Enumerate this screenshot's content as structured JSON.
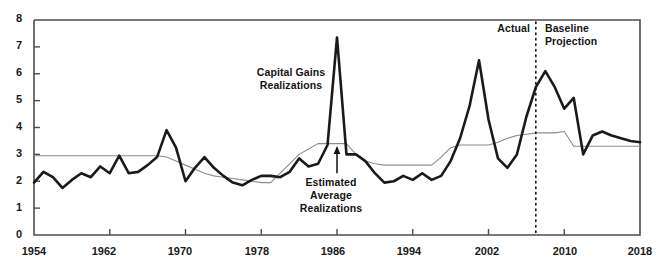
{
  "chart_data": {
    "type": "line",
    "title": "",
    "subtitle": "",
    "xlabel": "",
    "ylabel": "",
    "xlim": [
      1954,
      2018
    ],
    "ylim": [
      0,
      8
    ],
    "grid": false,
    "legend_position": "inline-annotations",
    "x_ticks": [
      1954,
      1962,
      1970,
      1978,
      1986,
      1994,
      2002,
      2010,
      2018
    ],
    "y_ticks": [
      0,
      1,
      2,
      3,
      4,
      5,
      6,
      7,
      8
    ],
    "x": [
      1954,
      1955,
      1956,
      1957,
      1958,
      1959,
      1960,
      1961,
      1962,
      1963,
      1964,
      1965,
      1966,
      1967,
      1968,
      1969,
      1970,
      1971,
      1972,
      1973,
      1974,
      1975,
      1976,
      1977,
      1978,
      1979,
      1980,
      1981,
      1982,
      1983,
      1984,
      1985,
      1986,
      1987,
      1988,
      1989,
      1990,
      1991,
      1992,
      1993,
      1994,
      1995,
      1996,
      1997,
      1998,
      1999,
      2000,
      2001,
      2002,
      2003,
      2004,
      2005,
      2006,
      2007,
      2008,
      2009,
      2010,
      2011,
      2012,
      2013,
      2014,
      2015,
      2016,
      2017,
      2018
    ],
    "series": [
      {
        "name": "Capital Gains Realizations",
        "color": "#1a1a1a",
        "width": 2.6,
        "values": [
          1.95,
          2.35,
          2.15,
          1.75,
          2.05,
          2.3,
          2.15,
          2.55,
          2.3,
          2.95,
          2.3,
          2.35,
          2.6,
          2.9,
          3.9,
          3.25,
          2.0,
          2.5,
          2.9,
          2.5,
          2.2,
          1.95,
          1.85,
          2.05,
          2.2,
          2.2,
          2.15,
          2.35,
          2.85,
          2.55,
          2.65,
          3.35,
          7.35,
          3.0,
          3.0,
          2.75,
          2.3,
          1.95,
          2.0,
          2.2,
          2.05,
          2.3,
          2.05,
          2.2,
          2.75,
          3.6,
          4.8,
          6.5,
          4.3,
          2.85,
          2.5,
          3.0,
          4.4,
          5.5,
          6.1,
          5.5,
          4.7,
          5.1,
          3.0,
          3.7,
          3.85,
          3.7,
          3.6,
          3.5,
          3.45
        ]
      },
      {
        "name": "Estimated Average Realizations",
        "color": "#8c8c8c",
        "width": 1.1,
        "values": [
          2.95,
          2.95,
          2.95,
          2.95,
          2.95,
          2.95,
          2.95,
          2.95,
          2.95,
          2.95,
          2.95,
          2.95,
          2.95,
          2.95,
          2.9,
          2.75,
          2.6,
          2.45,
          2.3,
          2.2,
          2.15,
          2.1,
          2.05,
          2.0,
          1.95,
          1.95,
          2.3,
          2.65,
          3.0,
          3.2,
          3.4,
          3.4,
          3.4,
          3.4,
          3.0,
          2.75,
          2.65,
          2.6,
          2.6,
          2.6,
          2.6,
          2.6,
          2.6,
          2.9,
          3.25,
          3.35,
          3.35,
          3.35,
          3.35,
          3.45,
          3.6,
          3.7,
          3.75,
          3.8,
          3.8,
          3.8,
          3.85,
          3.3,
          3.3,
          3.3,
          3.3,
          3.3,
          3.3,
          3.3,
          3.3
        ]
      }
    ],
    "annotations": [
      {
        "name": "capital-gains-realizations-label",
        "text_lines": [
          "Capital Gains",
          "Realizations"
        ],
        "x": 1954,
        "y": 6.2
      },
      {
        "name": "estimated-average-realizations-label",
        "text_lines": [
          "Estimated",
          "Average",
          "Realizations"
        ],
        "x": 1985,
        "y": 1.9
      },
      {
        "name": "actual-label",
        "text": "Actual",
        "x": 2005,
        "y": 7.6
      },
      {
        "name": "baseline-projection-label",
        "text_lines": [
          "Baseline",
          "Projection"
        ],
        "x": 2009,
        "y": 7.6
      }
    ],
    "divider": {
      "name": "actual-projection-divider",
      "x": 2007,
      "style": "dotted"
    },
    "arrow": {
      "name": "estimated-average-arrow",
      "from_y": 2.3,
      "to_y": 3.35,
      "x": 1986
    }
  },
  "axis": {
    "y_labels": [
      "8",
      "7",
      "6",
      "5",
      "4",
      "3",
      "2",
      "1",
      "0"
    ],
    "x_labels": [
      "1954",
      "1962",
      "1970",
      "1978",
      "1986",
      "1994",
      "2002",
      "2010",
      "2018"
    ]
  },
  "annotations": {
    "capital_gains_line1": "Capital Gains",
    "capital_gains_line2": "Realizations",
    "estimated_line1": "Estimated",
    "estimated_line2": "Average",
    "estimated_line3": "Realizations",
    "actual": "Actual",
    "baseline_line1": "Baseline",
    "baseline_line2": "Projection"
  },
  "colors": {
    "actual_series": "#1a1a1a",
    "estimated_series": "#8c8c8c",
    "axis": "#4d4d4d",
    "background": "#ffffff"
  }
}
